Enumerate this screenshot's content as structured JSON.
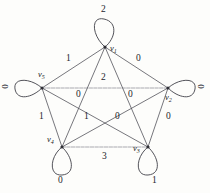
{
  "figure": {
    "kind": "weighted-graph",
    "background_color": "#fdfdfb",
    "ink_color": "#2e2e35"
  },
  "graph_data": {
    "type": "graph",
    "nodes": [
      {
        "id": "v1",
        "label": "v",
        "sub": "1",
        "x": 105,
        "y": 47,
        "loop_weight": "2",
        "loop_label_x": 101,
        "loop_label_y": 10,
        "name_x": 110,
        "name_y": 44
      },
      {
        "id": "v5",
        "label": "v",
        "sub": "5",
        "x": 42,
        "y": 88,
        "loop_weight": "0",
        "loop_label_x": 5,
        "loop_label_y": 84,
        "name_x": 42,
        "name_y": 73
      },
      {
        "id": "v2",
        "label": "v",
        "sub": "2",
        "x": 168,
        "y": 88,
        "loop_weight": "0",
        "loop_label_x": 198,
        "loop_label_y": 84,
        "name_x": 166,
        "name_y": 96
      },
      {
        "id": "v4",
        "label": "v",
        "sub": "4",
        "x": 62,
        "y": 147,
        "loop_weight": "0",
        "loop_label_x": 58,
        "loop_label_y": 178,
        "name_x": 47,
        "name_y": 138
      },
      {
        "id": "v3",
        "label": "v",
        "sub": "3",
        "x": 148,
        "y": 147,
        "loop_weight": "1",
        "loop_label_x": 152,
        "loop_label_y": 178,
        "name_x": 133,
        "name_y": 148
      }
    ],
    "edges": [
      {
        "from": "v1",
        "to": "v5",
        "weight": "1",
        "label_x": 66,
        "label_y": 60
      },
      {
        "from": "v1",
        "to": "v2",
        "weight": "0",
        "label_x": 136,
        "label_y": 60
      },
      {
        "from": "v5",
        "to": "v2",
        "weight": "2",
        "label_x": 101,
        "label_y": 78
      },
      {
        "from": "v1",
        "to": "v4",
        "weight": "0",
        "label_x": 77,
        "label_y": 95
      },
      {
        "from": "v1",
        "to": "v3",
        "weight": "0",
        "label_x": 129,
        "label_y": 95
      },
      {
        "from": "v5",
        "to": "v3",
        "weight": "1",
        "label_x": 84,
        "label_y": 117
      },
      {
        "from": "v2",
        "to": "v4",
        "weight": "0",
        "label_x": 115,
        "label_y": 117
      },
      {
        "from": "v5",
        "to": "v4",
        "weight": "1",
        "label_x": 40,
        "label_y": 117
      },
      {
        "from": "v2",
        "to": "v3",
        "weight": "0",
        "label_x": 166,
        "label_y": 117
      },
      {
        "from": "v4",
        "to": "v3",
        "weight": "3",
        "label_x": 102,
        "label_y": 158
      }
    ],
    "loops": [
      {
        "node": "v1",
        "direction": "up",
        "weight": "2"
      },
      {
        "node": "v5",
        "direction": "left",
        "weight": "0"
      },
      {
        "node": "v2",
        "direction": "right",
        "weight": "0"
      },
      {
        "node": "v4",
        "direction": "down",
        "weight": "0"
      },
      {
        "node": "v3",
        "direction": "down",
        "weight": "1"
      }
    ]
  }
}
